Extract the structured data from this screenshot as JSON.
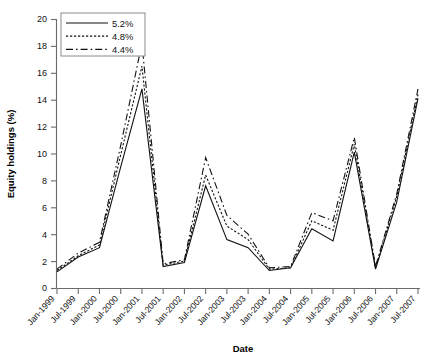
{
  "chart_data": {
    "type": "line",
    "title": "",
    "xlabel": "Date",
    "ylabel": "Equity holdings (%)",
    "ylim": [
      0,
      20
    ],
    "yticks": [
      0,
      2,
      4,
      6,
      8,
      10,
      12,
      14,
      16,
      18,
      20
    ],
    "grid": false,
    "legend_position": "top-left",
    "categories": [
      "Jan-1999",
      "Jul-1999",
      "Jan-2000",
      "Jul-2000",
      "Jan-2001",
      "Jul-2001",
      "Jan-2002",
      "Jul-2002",
      "Jan-2003",
      "Jul-2003",
      "Jan-2004",
      "Jul-2004",
      "Jan-2005",
      "Jul-2005",
      "Jan-2006",
      "Jul-2006",
      "Jan-2007",
      "Jul-2007"
    ],
    "series": [
      {
        "name": "5.2%",
        "style": "solid",
        "values": [
          1.2,
          2.3,
          3.0,
          9.0,
          14.8,
          1.6,
          1.9,
          7.6,
          3.6,
          3.0,
          1.3,
          1.5,
          4.4,
          3.5,
          10.1,
          1.4,
          6.4,
          14.1
        ]
      },
      {
        "name": "4.8%",
        "style": "dotted",
        "values": [
          1.3,
          2.4,
          3.2,
          9.9,
          16.5,
          1.7,
          2.0,
          8.4,
          4.6,
          3.6,
          1.4,
          1.5,
          5.0,
          4.3,
          10.7,
          1.5,
          6.8,
          14.4
        ]
      },
      {
        "name": "4.4%",
        "style": "dashdot",
        "values": [
          1.4,
          2.6,
          3.4,
          10.6,
          18.2,
          1.8,
          2.1,
          9.7,
          5.4,
          4.0,
          1.5,
          1.6,
          5.6,
          5.0,
          11.2,
          1.6,
          7.0,
          14.8
        ]
      }
    ]
  },
  "axes": {
    "y_tick_labels": [
      "0",
      "2",
      "4",
      "6",
      "8",
      "10",
      "12",
      "14",
      "16",
      "18",
      "20"
    ],
    "x_tick_labels": [
      "Jan-1999",
      "Jul-1999",
      "Jan-2000",
      "Jul-2000",
      "Jan-2001",
      "Jul-2001",
      "Jan-2002",
      "Jul-2002",
      "Jan-2003",
      "Jul-2003",
      "Jan-2004",
      "Jul-2004",
      "Jan-2005",
      "Jul-2005",
      "Jan-2006",
      "Jul-2006",
      "Jan-2007",
      "Jul-2007"
    ]
  },
  "legend": {
    "entries": [
      {
        "label": "5.2%"
      },
      {
        "label": "4.8%"
      },
      {
        "label": "4.4%"
      }
    ]
  },
  "colors": {
    "line": "#111111",
    "axis": "#6b6b6b",
    "background": "#ffffff"
  }
}
